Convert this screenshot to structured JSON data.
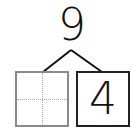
{
  "number_bond": {
    "whole": "9",
    "parts": [
      {
        "value": "",
        "state": "empty"
      },
      {
        "value": "4",
        "state": "filled"
      }
    ]
  }
}
